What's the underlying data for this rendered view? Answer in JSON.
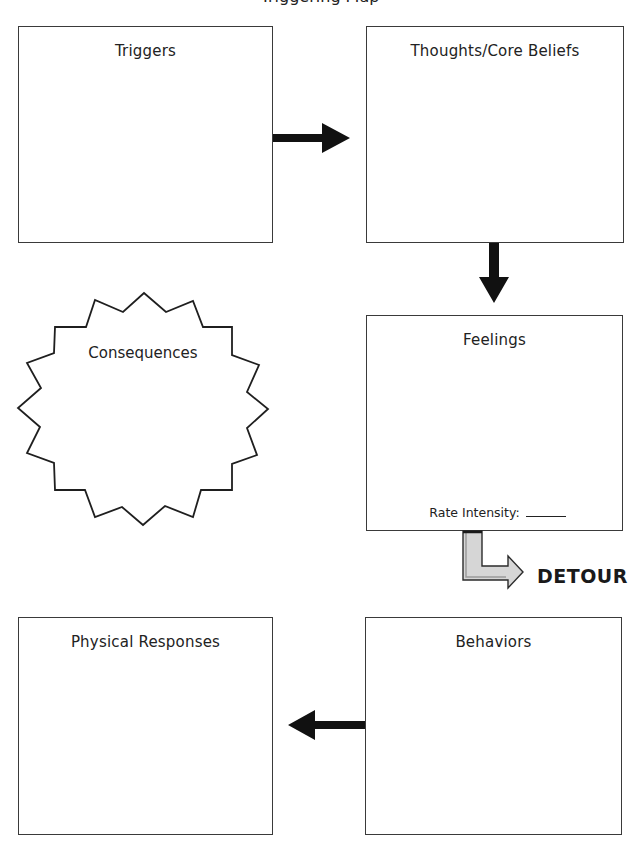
{
  "page": {
    "title": "Triggering Map"
  },
  "boxes": {
    "triggers": {
      "label": "Triggers"
    },
    "thoughts": {
      "label": "Thoughts/Core Beliefs"
    },
    "feelings": {
      "label": "Feelings",
      "rate_label": "Rate Intensity:",
      "rate_value": ""
    },
    "physical": {
      "label": "Physical Responses"
    },
    "behaviors": {
      "label": "Behaviors"
    }
  },
  "consequences": {
    "label": "Consequences"
  },
  "detour": {
    "label": "DETOUR"
  },
  "colors": {
    "border": "#3a3a3a",
    "arrow": "#111111",
    "detour_fill": "#d6d6d6",
    "detour_stroke": "#2b2b2b"
  },
  "arrows": [
    {
      "from": "Triggers",
      "to": "Thoughts/Core Beliefs",
      "direction": "right"
    },
    {
      "from": "Thoughts/Core Beliefs",
      "to": "Feelings",
      "direction": "down"
    },
    {
      "from": "Feelings",
      "to": "DETOUR",
      "direction": "down-right",
      "style": "outlined-gray"
    },
    {
      "from": "Behaviors",
      "to": "Physical Responses",
      "direction": "left"
    }
  ]
}
